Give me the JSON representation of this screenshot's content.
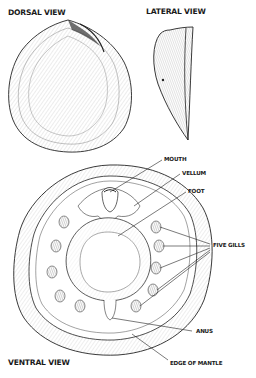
{
  "figure": {
    "views": {
      "dorsal": {
        "title": "DORSAL VIEW"
      },
      "lateral": {
        "title": "LATERAL VIEW"
      },
      "ventral": {
        "title": "VENTRAL VIEW"
      }
    },
    "labels": {
      "mouth": "MOUTH",
      "vellum": "VELLUM",
      "foot": "FOOT",
      "five_gills": "FIVE GILLS",
      "anus": "ANUS",
      "edge_of_mantle": "EDGE OF MANTLE"
    },
    "colors": {
      "ink": "#1a1a1a",
      "hatch": "#555555",
      "background": "#ffffff"
    }
  }
}
